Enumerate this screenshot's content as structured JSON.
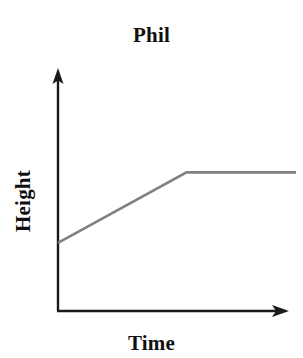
{
  "chart_data": {
    "type": "line",
    "title": "Phil",
    "xlabel": "Time",
    "ylabel": "Height",
    "grid": false,
    "legend": null,
    "xlim": [
      0,
      100
    ],
    "ylim": [
      0,
      100
    ],
    "x_tick_labels": [],
    "y_tick_labels": [],
    "series": [
      {
        "name": "Phil height over time",
        "color": "#808080",
        "x": [
          0,
          54,
          100
        ],
        "y": [
          29,
          59,
          59
        ],
        "description": "Height rises steadily from a non-zero starting value, then levels off and stays constant."
      }
    ],
    "annotations": []
  },
  "figure": {
    "background_color": "#ffffff",
    "axis_color": "#1a1a1a",
    "line_color": "#808080",
    "axis_arrow_x": "arrow-right",
    "axis_arrow_y": "arrow-up"
  }
}
